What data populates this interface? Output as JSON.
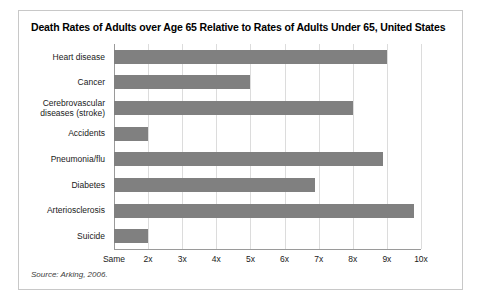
{
  "figure": {
    "title": "Death Rates of Adults over Age 65 Relative to Rates of Adults Under 65, United States",
    "source": "Source: Arking, 2006.",
    "frame_color": "#c8c8c8",
    "bar_color": "#808080",
    "grid_color": "#dcdcdc",
    "axis_color": "#9a9a9a"
  },
  "chart_data": {
    "type": "bar",
    "orientation": "horizontal",
    "title": "Death Rates of Adults over Age 65 Relative to Rates of Adults Under 65, United States",
    "xlabel": "",
    "ylabel": "",
    "categories": [
      "Heart disease",
      "Cancer",
      "Cerebrovascular diseases (stroke)",
      "Accidents",
      "Pneumonia/flu",
      "Diabetes",
      "Arteriosclerosis",
      "Suicide"
    ],
    "values": [
      9.0,
      5.0,
      8.0,
      2.0,
      8.9,
      6.9,
      9.8,
      2.0
    ],
    "xlim": [
      1,
      10
    ],
    "xticks": [
      1,
      2,
      3,
      4,
      5,
      6,
      7,
      8,
      9,
      10
    ],
    "xticklabels": [
      "Same",
      "2x",
      "3x",
      "4x",
      "5x",
      "6x",
      "7x",
      "8x",
      "9x",
      "10x"
    ],
    "grid": true,
    "legend": null,
    "series": [
      {
        "name": "Relative death rate",
        "values": [
          9.0,
          5.0,
          8.0,
          2.0,
          8.9,
          6.9,
          9.8,
          2.0
        ]
      }
    ]
  },
  "categories_display": [
    {
      "lines": [
        "Heart disease"
      ]
    },
    {
      "lines": [
        "Cancer"
      ]
    },
    {
      "lines": [
        "Cerebrovascular",
        "diseases (stroke)"
      ]
    },
    {
      "lines": [
        "Accidents"
      ]
    },
    {
      "lines": [
        "Pneumonia/flu"
      ]
    },
    {
      "lines": [
        "Diabetes"
      ]
    },
    {
      "lines": [
        "Arteriosclerosis"
      ]
    },
    {
      "lines": [
        "Suicide"
      ]
    }
  ]
}
